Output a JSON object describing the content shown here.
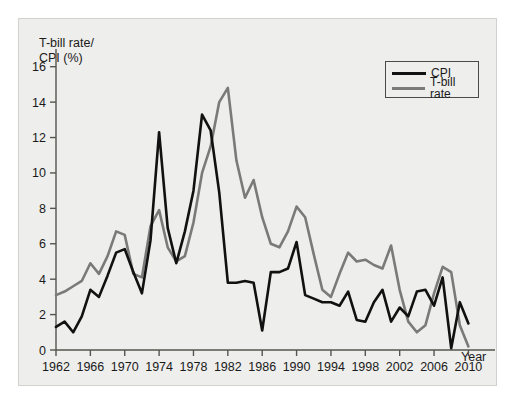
{
  "figure": {
    "y_axis_title": "T-bill rate/\nCPI (%)",
    "x_axis_title": "Year"
  },
  "legend": {
    "position": "top-right",
    "items": [
      {
        "label": "CPI",
        "color": "#111111",
        "style": "solid"
      },
      {
        "label": "T-bill rate",
        "color": "#7a7a7a",
        "style": "solid"
      }
    ]
  },
  "axes": {
    "y_ticks": [
      "0",
      "2",
      "4",
      "6",
      "8",
      "10",
      "12",
      "14",
      "16"
    ],
    "x_ticks": [
      "1962",
      "1966",
      "1970",
      "1974",
      "1978",
      "1982",
      "1986",
      "1990",
      "1994",
      "1998",
      "2002",
      "2006",
      "2010"
    ]
  },
  "chart_data": {
    "type": "line",
    "title": "",
    "xlabel": "Year",
    "ylabel": "T-bill rate/ CPI (%)",
    "xlim": [
      1962,
      2011
    ],
    "ylim": [
      0,
      17
    ],
    "grid": false,
    "legend_position": "top-right",
    "x": [
      1962,
      1963,
      1964,
      1965,
      1966,
      1967,
      1968,
      1969,
      1970,
      1971,
      1972,
      1973,
      1974,
      1975,
      1976,
      1977,
      1978,
      1979,
      1980,
      1981,
      1982,
      1983,
      1984,
      1985,
      1986,
      1987,
      1988,
      1989,
      1990,
      1991,
      1992,
      1993,
      1994,
      1995,
      1996,
      1997,
      1998,
      1999,
      2000,
      2001,
      2002,
      2003,
      2004,
      2005,
      2006,
      2007,
      2008,
      2009,
      2010
    ],
    "series": [
      {
        "name": "CPI",
        "color": "#111111",
        "values": [
          1.3,
          1.6,
          1.0,
          1.9,
          3.4,
          3.0,
          4.2,
          5.5,
          5.7,
          4.4,
          3.2,
          6.2,
          12.3,
          6.9,
          4.9,
          6.7,
          9.0,
          13.3,
          12.4,
          8.9,
          3.8,
          3.8,
          3.9,
          3.8,
          1.1,
          4.4,
          4.4,
          4.6,
          6.1,
          3.1,
          2.9,
          2.7,
          2.7,
          2.5,
          3.3,
          1.7,
          1.6,
          2.7,
          3.4,
          1.6,
          2.4,
          1.9,
          3.3,
          3.4,
          2.5,
          4.1,
          0.1,
          2.7,
          1.5
        ]
      },
      {
        "name": "T-bill rate",
        "color": "#7a7a7a",
        "values": [
          3.1,
          3.3,
          3.6,
          3.9,
          4.9,
          4.3,
          5.3,
          6.7,
          6.5,
          4.3,
          4.1,
          7.0,
          7.9,
          5.8,
          5.0,
          5.3,
          7.2,
          10.0,
          11.5,
          14.0,
          14.8,
          10.7,
          8.6,
          9.6,
          7.5,
          6.0,
          5.8,
          6.7,
          8.1,
          7.5,
          5.4,
          3.4,
          3.0,
          4.3,
          5.5,
          5.0,
          5.1,
          4.8,
          4.6,
          5.9,
          3.4,
          1.6,
          1.0,
          1.4,
          3.2,
          4.7,
          4.4,
          1.4,
          0.2
        ]
      }
    ]
  }
}
